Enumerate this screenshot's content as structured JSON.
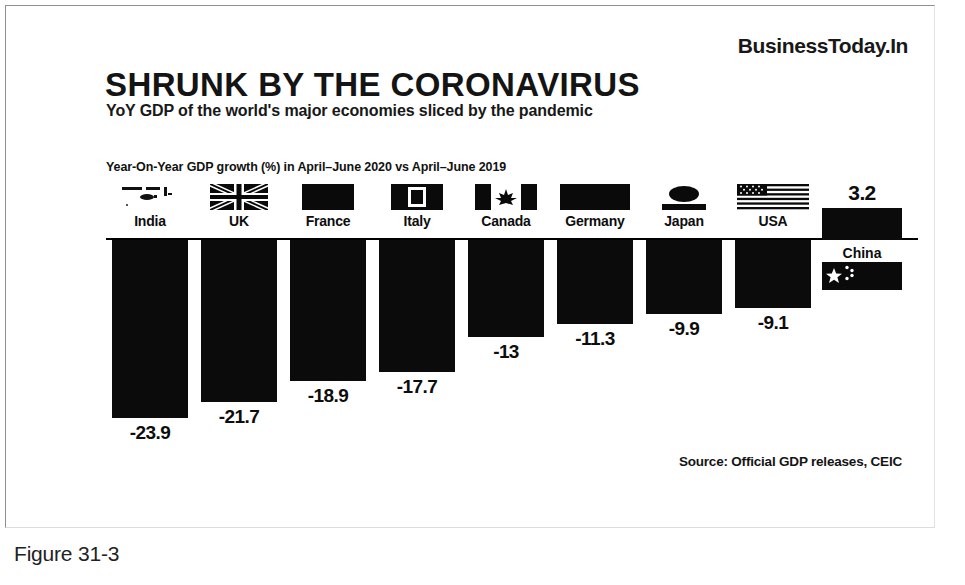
{
  "brand": "BusinessToday.In",
  "headline": "SHRUNK BY THE CORONAVIRUS",
  "deck": "YoY GDP of the world's major economies sliced by the pandemic",
  "axis_caption": "Year-On-Year GDP growth (%) in April–June 2020 vs April–June 2019",
  "source": "Source: Official GDP releases, CEIC",
  "figure_caption": "Figure 31-3",
  "colors": {
    "bar": "#0b0b0b",
    "axis": "#000000",
    "text": "#0d0d0d",
    "background": "#ffffff",
    "frame": "#8f8f8f"
  },
  "chart_data": {
    "type": "bar",
    "title": "SHRUNK BY THE CORONAVIRUS",
    "subtitle": "YoY GDP of the world's major economies sliced by the pandemic",
    "xlabel": "",
    "ylabel": "Year-On-Year GDP growth (%) in April–June 2020 vs April–June 2019",
    "categories": [
      "India",
      "UK",
      "France",
      "Italy",
      "Canada",
      "Germany",
      "Japan",
      "USA",
      "China"
    ],
    "values": [
      -23.9,
      -21.7,
      -18.9,
      -17.7,
      -13,
      -11.3,
      -9.9,
      -9.1,
      3.2
    ],
    "value_labels": [
      "-23.9",
      "-21.7",
      "-18.9",
      "-17.7",
      "-13",
      "-11.3",
      "-9.9",
      "-9.1",
      "3.2"
    ],
    "ylim": [
      -26,
      5
    ],
    "grid": false,
    "legend": false,
    "orientation": "vertical",
    "zero_line": true,
    "source": "Source: Official GDP releases, CEIC"
  },
  "bars": [
    {
      "country": "India",
      "label": "-23.9",
      "flag": "flag-india-icon",
      "value": -23.9
    },
    {
      "country": "UK",
      "label": "-21.7",
      "flag": "flag-uk-icon",
      "value": -21.7
    },
    {
      "country": "France",
      "label": "-18.9",
      "flag": "flag-france-icon",
      "value": -18.9
    },
    {
      "country": "Italy",
      "label": "-17.7",
      "flag": "flag-italy-icon",
      "value": -17.7
    },
    {
      "country": "Canada",
      "label": "-13",
      "flag": "flag-canada-icon",
      "value": -13
    },
    {
      "country": "Germany",
      "label": "-11.3",
      "flag": "flag-germany-icon",
      "value": -11.3
    },
    {
      "country": "Japan",
      "label": "-9.9",
      "flag": "flag-japan-icon",
      "value": -9.9
    },
    {
      "country": "USA",
      "label": "-9.1",
      "flag": "flag-usa-icon",
      "value": -9.1
    }
  ],
  "china": {
    "country": "China",
    "label": "3.2",
    "flag": "flag-china-icon",
    "value": 3.2
  }
}
